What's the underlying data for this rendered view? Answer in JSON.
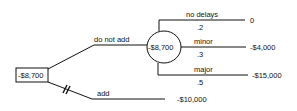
{
  "decision_node": {
    "value": "-$8,700"
  },
  "branches": {
    "do_not_add": {
      "label": "do not add"
    },
    "add": {
      "label": "add",
      "outcome": "-$10,000"
    }
  },
  "chance_node": {
    "value": "-$8,700"
  },
  "outcomes": [
    {
      "label": "no delays",
      "prob": ".2",
      "value": "0"
    },
    {
      "label": "minor",
      "prob": ".3",
      "value": "-$4,000"
    },
    {
      "label": "major",
      "prob": ".5",
      "value": "-$15,000"
    }
  ]
}
